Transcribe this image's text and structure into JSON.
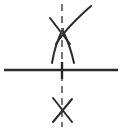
{
  "canvas": {
    "width": 129,
    "height": 131,
    "background": "#ffffff",
    "title": "abstract line diagram"
  },
  "style": {
    "stroke_color": "#2b2b2b",
    "stroke_color_light": "#555555",
    "baseline_width": 2.4,
    "symbol_width": 2.0,
    "centerline_width": 1.6,
    "centerline_dash": "7 5"
  },
  "elements": {
    "baseline": {
      "name": "horizontal baseline",
      "x1": 4,
      "y1": 70,
      "x2": 118,
      "y2": 70
    },
    "centerline": {
      "name": "vertical dashed centerline",
      "x": 62,
      "y1": 4,
      "y2": 127
    },
    "upper_symbol": {
      "name": "upper crossing symbol with splayed arcs",
      "cross_x": 62,
      "cross_y": 31,
      "stroke_left_top": {
        "x": 50,
        "y": 18
      },
      "stroke_right_top": {
        "x": 73,
        "y": 20
      },
      "arc_left_end": {
        "x": 52,
        "y": 62
      },
      "arc_right_end": {
        "x": 74,
        "y": 62
      },
      "sweep_curve_end": {
        "x": 91,
        "y": 5
      }
    },
    "lower_symbol": {
      "name": "lower crossing symbol",
      "cross_x": 62,
      "cross_y": 110,
      "stroke_left_top": {
        "x": 53,
        "y": 98
      },
      "stroke_right_top": {
        "x": 72,
        "y": 99
      },
      "stroke_left_bottom": {
        "x": 53,
        "y": 122
      },
      "stroke_right_bottom": {
        "x": 72,
        "y": 122
      }
    }
  }
}
